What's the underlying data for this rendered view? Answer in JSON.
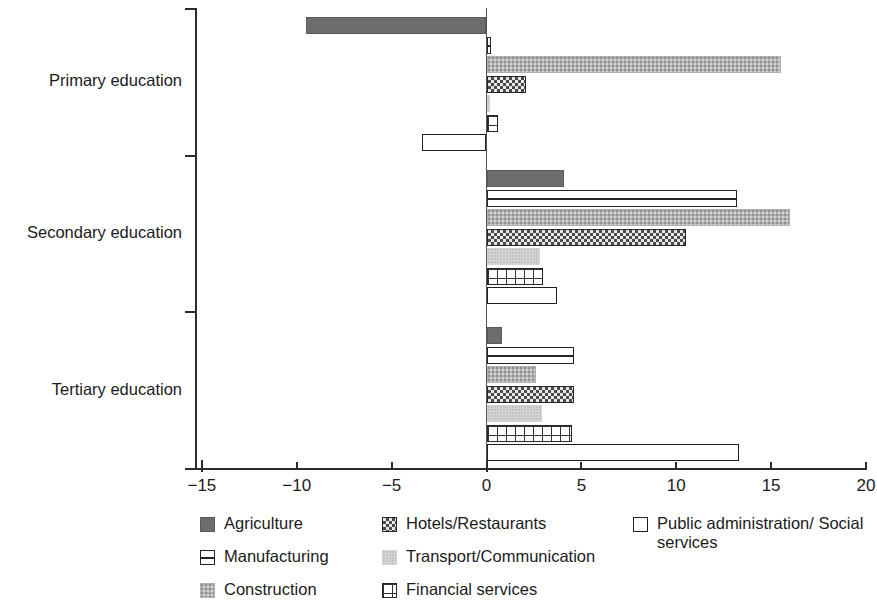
{
  "chart_data": {
    "type": "bar",
    "orientation": "horizontal",
    "title": "",
    "subtitle": "",
    "xlabel": "",
    "ylabel": "",
    "xlim": [
      -15,
      20
    ],
    "ylim": null,
    "grid": false,
    "legend_position": "bottom",
    "categories": [
      "Primary education",
      "Secondary education",
      "Tertiary education"
    ],
    "xticks": [
      -15,
      -10,
      -5,
      0,
      5,
      10,
      15,
      20
    ],
    "xtick_labels": [
      "−15",
      "−10",
      "−5",
      "0",
      "5",
      "10",
      "15",
      "20"
    ],
    "series": [
      {
        "name": "Agriculture",
        "pattern": "solid-dark-gray",
        "color": "#6d6d6d",
        "values": [
          -9.5,
          4.1,
          0.8
        ]
      },
      {
        "name": "Manufacturing",
        "pattern": "horizontal-line-box",
        "color": "#ffffff",
        "values": [
          0.25,
          13.2,
          4.6
        ]
      },
      {
        "name": "Construction",
        "pattern": "speckled-light-gray",
        "color": "#b4b4b4",
        "values": [
          15.5,
          16.0,
          2.6
        ]
      },
      {
        "name": "Hotels/Restaurants",
        "pattern": "crosshatch-diagonal",
        "color": "#e8e8e8",
        "values": [
          2.1,
          10.5,
          4.6
        ]
      },
      {
        "name": "Transport/Communication",
        "pattern": "pale-gray-dots",
        "color": "#d6d6d6",
        "values": [
          0.18,
          2.8,
          2.9
        ]
      },
      {
        "name": "Financial services",
        "pattern": "grid-squares",
        "color": "#ffffff",
        "values": [
          0.6,
          3.0,
          4.5
        ]
      },
      {
        "name": "Public administration/Social services",
        "pattern": "open-outline",
        "color": "#ffffff",
        "values": [
          -3.4,
          3.7,
          13.3
        ]
      }
    ]
  },
  "legend": {
    "columns": [
      {
        "items": [
          {
            "label": "Agriculture",
            "swatch": "agriculture"
          },
          {
            "label": "Manufacturing",
            "swatch": "manufacturing"
          },
          {
            "label": "Construction",
            "swatch": "construction"
          }
        ]
      },
      {
        "items": [
          {
            "label": "Hotels/Restaurants",
            "swatch": "hotels"
          },
          {
            "label": "Transport/Communication",
            "swatch": "transport"
          },
          {
            "label": "Financial services",
            "swatch": "financial"
          }
        ]
      },
      {
        "items": [
          {
            "label": "Public administration/ Social services",
            "swatch": "public"
          }
        ]
      }
    ]
  }
}
